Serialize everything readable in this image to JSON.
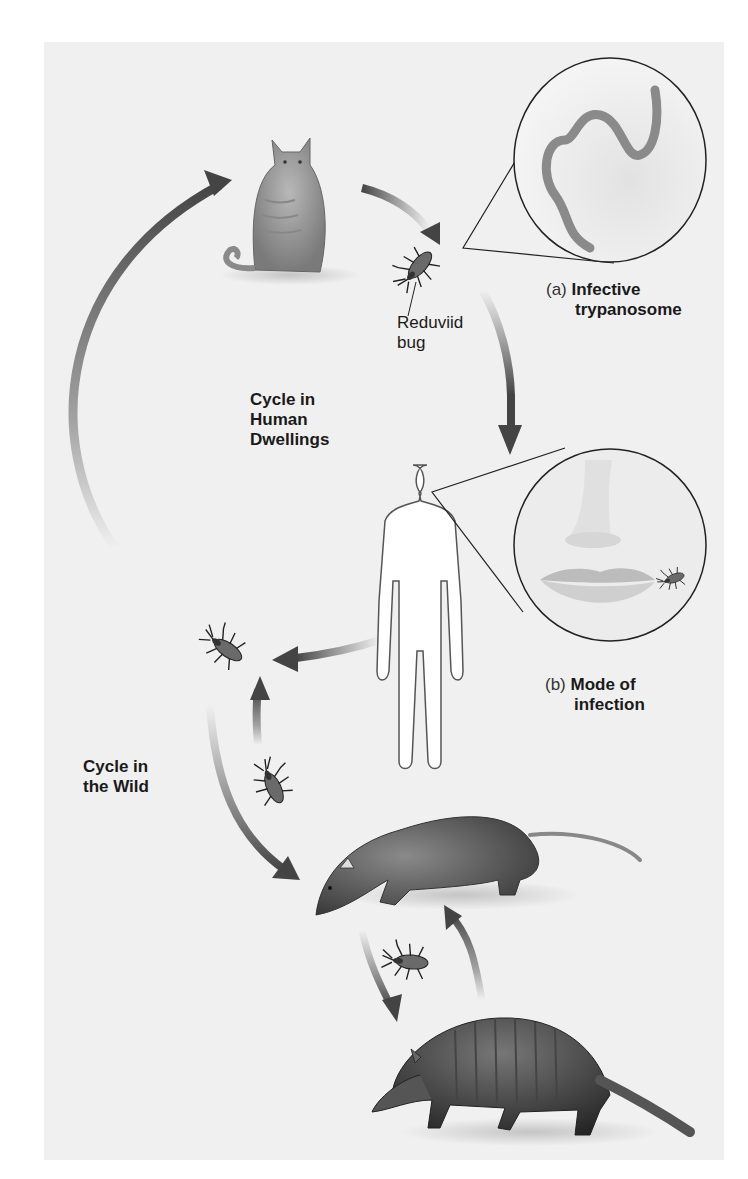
{
  "figure": {
    "labels": {
      "reduviid_bug": [
        "Reduviid",
        "bug"
      ],
      "cycle_human": [
        "Cycle in",
        "Human",
        "Dwellings"
      ],
      "cycle_wild": [
        "Cycle in",
        "the Wild"
      ],
      "inset_a_prefix": "(a)",
      "inset_a_title": [
        "Infective",
        "trypanosome"
      ],
      "inset_b_prefix": "(b)",
      "inset_b_title": [
        "Mode of",
        "infection"
      ]
    },
    "elements": [
      {
        "id": "cat",
        "name": "Cat"
      },
      {
        "id": "reduviid-bug",
        "name": "Reduviid bug"
      },
      {
        "id": "trypanosome-inset",
        "name": "Infective trypanosome (magnified)"
      },
      {
        "id": "human",
        "name": "Human"
      },
      {
        "id": "mouth-inset",
        "name": "Bug biting near mouth"
      },
      {
        "id": "wild-bug-1",
        "name": "Reduviid bug"
      },
      {
        "id": "wild-bug-2",
        "name": "Reduviid bug"
      },
      {
        "id": "opossum",
        "name": "Opossum"
      },
      {
        "id": "wild-bug-3",
        "name": "Reduviid bug"
      },
      {
        "id": "armadillo",
        "name": "Armadillo"
      }
    ],
    "colors": {
      "panel_bg": "#f0f0f0",
      "arrow": "#555555",
      "text": "#1a1a1a"
    }
  }
}
